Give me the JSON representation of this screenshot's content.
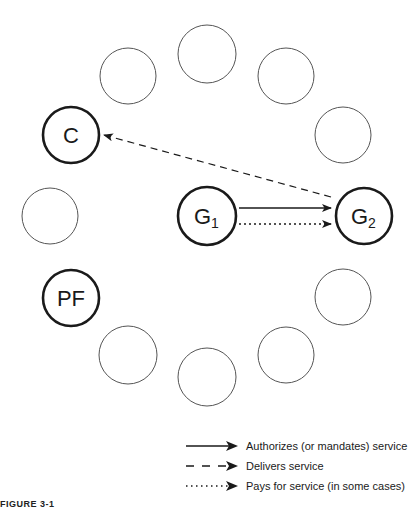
{
  "figure": {
    "caption": "FIGURE 3-1"
  },
  "nodes": [
    {
      "id": "top",
      "label": "",
      "cx": 207,
      "cy": 54,
      "r": 29,
      "bold": false
    },
    {
      "id": "upper-left",
      "label": "",
      "cx": 128,
      "cy": 76,
      "r": 28,
      "bold": false
    },
    {
      "id": "upper-right",
      "label": "",
      "cx": 286,
      "cy": 76,
      "r": 28,
      "bold": false
    },
    {
      "id": "right-upper",
      "label": "",
      "cx": 343,
      "cy": 135,
      "r": 28,
      "bold": false
    },
    {
      "id": "C",
      "label": "C",
      "cx": 71,
      "cy": 135,
      "r": 28,
      "bold": true
    },
    {
      "id": "left",
      "label": "",
      "cx": 50,
      "cy": 216,
      "r": 28,
      "bold": false
    },
    {
      "id": "G1",
      "label": "G",
      "sub": "1",
      "cx": 207,
      "cy": 216,
      "r": 29,
      "bold": true
    },
    {
      "id": "G2",
      "label": "G",
      "sub": "2",
      "cx": 364,
      "cy": 216,
      "r": 28,
      "bold": true
    },
    {
      "id": "PF",
      "label": "PF",
      "cx": 71,
      "cy": 298,
      "r": 28,
      "bold": true
    },
    {
      "id": "lower-left",
      "label": "",
      "cx": 128,
      "cy": 355,
      "r": 29,
      "bold": false
    },
    {
      "id": "bottom",
      "label": "",
      "cx": 207,
      "cy": 377,
      "r": 29,
      "bold": false
    },
    {
      "id": "lower-right",
      "label": "",
      "cx": 286,
      "cy": 355,
      "r": 28,
      "bold": false
    },
    {
      "id": "right-lower",
      "label": "",
      "cx": 343,
      "cy": 297,
      "r": 28,
      "bold": false
    }
  ],
  "edges": [
    {
      "from": "G1",
      "to": "G2",
      "type": "solid",
      "meaning": "Authorizes (or mandates) service"
    },
    {
      "from": "G1",
      "to": "G2",
      "type": "dotted",
      "meaning": "Pays for service (in some cases)"
    },
    {
      "from": "G2",
      "to": "C",
      "type": "dashed",
      "meaning": "Delivers service"
    }
  ],
  "labels": {
    "C": "C",
    "G1_main": "G",
    "G1_sub": "1",
    "G2_main": "G",
    "G2_sub": "2",
    "PF": "PF"
  },
  "legend": {
    "items": [
      {
        "style": "solid",
        "label": "Authorizes (or mandates) service"
      },
      {
        "style": "dashed",
        "label": "Delivers service"
      },
      {
        "style": "dotted",
        "label": "Pays for service (in some cases)"
      }
    ]
  },
  "colors": {
    "stroke": "#1a1a1a",
    "thin_stroke": "#555555",
    "background": "#ffffff"
  }
}
